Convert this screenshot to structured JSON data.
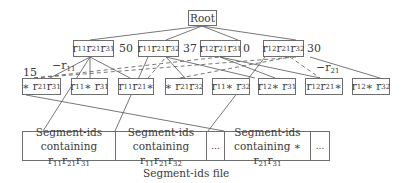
{
  "diagram": {
    "root": {
      "label": "Root"
    },
    "level1": [
      {
        "id": "n1",
        "parts": [
          "r",
          "11",
          "r",
          "21",
          "r",
          "31"
        ],
        "count": "50"
      },
      {
        "id": "n2",
        "parts": [
          "r",
          "11",
          "r",
          "21",
          "r",
          "32"
        ],
        "count": "37"
      },
      {
        "id": "n3",
        "parts": [
          "r",
          "12",
          "r",
          "21",
          "r",
          "31"
        ],
        "count": "0"
      },
      {
        "id": "n4",
        "parts": [
          "r",
          "12",
          "r",
          "21",
          "r",
          "32"
        ],
        "count": "30"
      }
    ],
    "level2": [
      {
        "id": "m1",
        "text": "* r21r31"
      },
      {
        "id": "m2",
        "text": "r11 * r31"
      },
      {
        "id": "m3",
        "text": "r11r21*"
      },
      {
        "id": "m4",
        "text": "* r21r32"
      },
      {
        "id": "m5",
        "text": "r11 * r32"
      },
      {
        "id": "m6",
        "text": "r12 * r31"
      },
      {
        "id": "m7",
        "text": "r12 r21*"
      },
      {
        "id": "m8",
        "text": "r12 * r32"
      }
    ],
    "annotations": {
      "count_m1": "15",
      "edge_label_left": "−r11",
      "edge_label_right": "−r21"
    },
    "file": {
      "cells": [
        {
          "line1": "Segment-ids",
          "line2": "containing r11r21r31"
        },
        {
          "line1": "Segment-ids",
          "line2": "containing r11r21r32"
        },
        {
          "line1": "...",
          "line2": ""
        },
        {
          "line1": "Segment-ids",
          "line2": "containing * r21r31"
        },
        {
          "line1": "...",
          "line2": ""
        }
      ],
      "caption": "Segment-ids file"
    }
  }
}
